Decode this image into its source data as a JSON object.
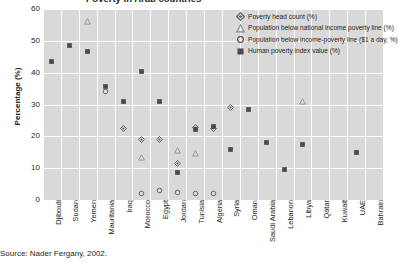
{
  "title_clipped": "Poverty in Arab countries",
  "source": "Source: Nader Fergany, 2002.",
  "axis": {
    "ylabel": "Percentage (%)",
    "yticks": [
      "60",
      "50",
      "40",
      "30",
      "20",
      "10",
      "0"
    ]
  },
  "legend": {
    "items": [
      {
        "marker": "diamond-open-marker",
        "label": "Poverty head count (%)"
      },
      {
        "marker": "triangle-open-marker",
        "label": "Population below national income poverty line (%)"
      },
      {
        "marker": "circle-open-marker",
        "label": "Population below income-poverty line ($1 a day, %)"
      },
      {
        "marker": "square-filled-marker",
        "label": "Human poverty index value (%)"
      }
    ]
  },
  "chart_data": {
    "type": "scatter",
    "title": "Poverty in Arab countries",
    "xlabel": "",
    "ylabel": "Percentage (%)",
    "ylim": [
      0,
      60
    ],
    "ytick_step": 10,
    "grid": true,
    "legend_position": "top-right",
    "categories": [
      "Djibouti",
      "Sudan",
      "Yemen",
      "Mauritania",
      "Iraq",
      "Morocco",
      "Egypt",
      "Jordan",
      "Tunisia",
      "Algeria",
      "Syria",
      "Oman",
      "Saudi Arabia",
      "Lebanon",
      "Libya",
      "Qatar",
      "Kuwait",
      "UAE",
      "Bahrain"
    ],
    "series": [
      {
        "name": "Poverty head count (%)",
        "marker": "diamond-open-marker",
        "values": [
          null,
          null,
          null,
          null,
          22.5,
          19.0,
          19.0,
          11.5,
          22.8,
          22.5,
          29.0,
          null,
          null,
          null,
          null,
          null,
          null,
          null,
          null
        ]
      },
      {
        "name": "Population below national income poverty line (%)",
        "marker": "triangle-open-marker",
        "values": [
          null,
          null,
          56.0,
          null,
          null,
          13.5,
          null,
          15.5,
          14.5,
          null,
          null,
          null,
          null,
          null,
          31.0,
          null,
          null,
          null,
          null
        ]
      },
      {
        "name": "Population below income-poverty line ($1 a day, %)",
        "marker": "circle-open-marker",
        "values": [
          null,
          null,
          null,
          34.0,
          null,
          2.0,
          3.0,
          2.5,
          2.0,
          2.0,
          null,
          null,
          null,
          null,
          null,
          null,
          null,
          null,
          null
        ]
      },
      {
        "name": "Human poverty index value (%)",
        "marker": "square-filled-marker",
        "values": [
          43.5,
          48.5,
          46.5,
          35.5,
          31.0,
          40.5,
          31.0,
          8.5,
          22.0,
          23.0,
          16.0,
          28.5,
          18.0,
          9.5,
          17.5,
          null,
          null,
          15.0,
          null
        ]
      }
    ]
  }
}
